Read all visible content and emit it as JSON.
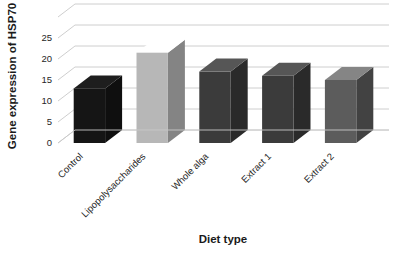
{
  "chart_data": {
    "type": "bar",
    "title": "",
    "subtitle": "",
    "xlabel": "Diet type",
    "ylabel": "Gene expression of HSP70",
    "categories": [
      "Control",
      "Lipopolysaccharides",
      "Whole alga",
      "Extract 1",
      "Extract 2"
    ],
    "values": [
      13,
      21.5,
      17,
      16,
      15
    ],
    "series": [
      {
        "name": "Gene expression of HSP70",
        "values": [
          13,
          21.5,
          17,
          16,
          15
        ]
      }
    ],
    "ylim": [
      0,
      30
    ],
    "yticks": [
      0,
      5,
      10,
      15,
      20,
      25
    ],
    "ytick_labels": [
      "0",
      "5",
      "10",
      "15",
      "20",
      "25"
    ],
    "grid": true,
    "grid_axis": "y",
    "legend": false,
    "legend_position": "none",
    "three_d": true,
    "bar_colors": [
      "#151515",
      "#b7b7b7",
      "#3b3b3b",
      "#3b3b3b",
      "#5c5c5c"
    ],
    "annotations": []
  },
  "style": {
    "background": "#ffffff",
    "gridline_color": "#c8c8c8",
    "text_color": "#262626",
    "axis_title_color": "#1a1a1a"
  }
}
